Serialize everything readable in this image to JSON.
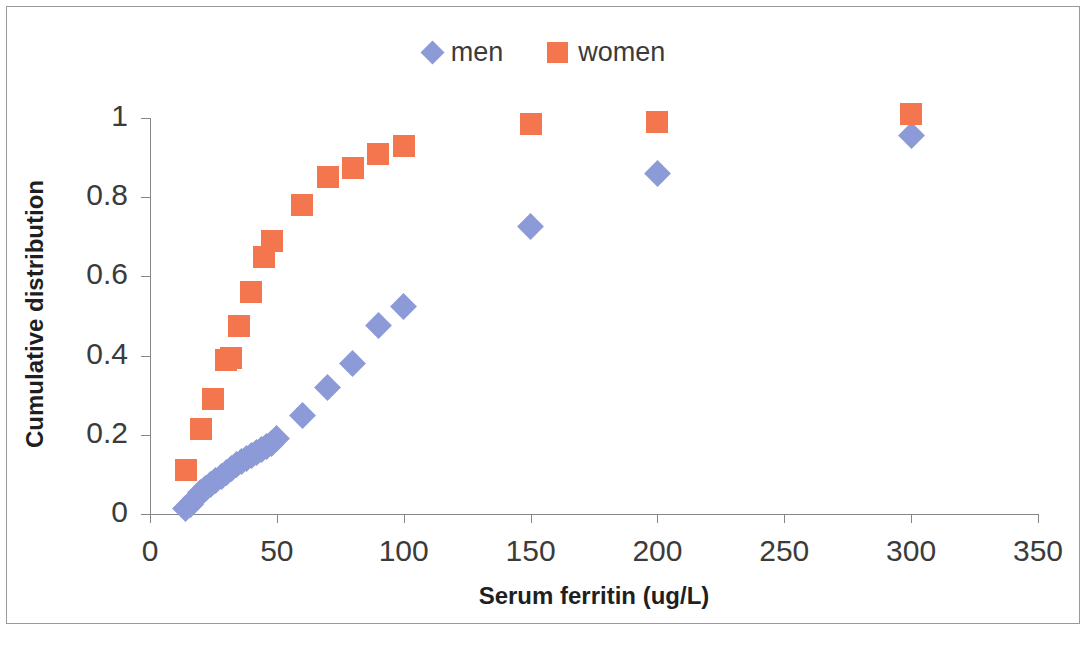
{
  "chart_data": {
    "type": "scatter",
    "title": "",
    "xlabel": "Serum ferritin (ug/L)",
    "ylabel": "Cumulative distribution",
    "xlim": [
      0,
      350
    ],
    "ylim": [
      0,
      1
    ],
    "xticks": [
      0,
      50,
      100,
      150,
      200,
      250,
      300,
      350
    ],
    "yticks": [
      0,
      0.2,
      0.4,
      0.6,
      0.8,
      1
    ],
    "xtick_labels": [
      "0",
      "50",
      "100",
      "150",
      "200",
      "250",
      "300",
      "350"
    ],
    "ytick_labels": [
      "0",
      "0.2",
      "0.4",
      "0.6",
      "0.8",
      "1"
    ],
    "grid": false,
    "legend_position": "top-center",
    "series": [
      {
        "name": "men",
        "marker": "diamond",
        "color": "#8C9AD8",
        "points": [
          [
            14,
            0.015
          ],
          [
            16,
            0.025
          ],
          [
            18,
            0.04
          ],
          [
            20,
            0.055
          ],
          [
            22,
            0.065
          ],
          [
            24,
            0.075
          ],
          [
            26,
            0.085
          ],
          [
            28,
            0.095
          ],
          [
            30,
            0.105
          ],
          [
            32,
            0.115
          ],
          [
            34,
            0.125
          ],
          [
            36,
            0.132
          ],
          [
            38,
            0.14
          ],
          [
            40,
            0.148
          ],
          [
            42,
            0.155
          ],
          [
            44,
            0.162
          ],
          [
            46,
            0.17
          ],
          [
            48,
            0.178
          ],
          [
            50,
            0.19
          ],
          [
            60,
            0.25
          ],
          [
            70,
            0.32
          ],
          [
            80,
            0.38
          ],
          [
            90,
            0.475
          ],
          [
            100,
            0.525
          ],
          [
            150,
            0.725
          ],
          [
            200,
            0.86
          ],
          [
            300,
            0.955
          ]
        ]
      },
      {
        "name": "women",
        "marker": "square",
        "color": "#F4764E",
        "points": [
          [
            14,
            0.11
          ],
          [
            20,
            0.215
          ],
          [
            25,
            0.29
          ],
          [
            30,
            0.39
          ],
          [
            32,
            0.395
          ],
          [
            35,
            0.475
          ],
          [
            40,
            0.56
          ],
          [
            45,
            0.65
          ],
          [
            48,
            0.69
          ],
          [
            60,
            0.78
          ],
          [
            70,
            0.85
          ],
          [
            80,
            0.875
          ],
          [
            90,
            0.91
          ],
          [
            100,
            0.93
          ],
          [
            150,
            0.985
          ],
          [
            200,
            0.99
          ],
          [
            300,
            1.01
          ]
        ]
      }
    ]
  },
  "legend": {
    "entries": [
      {
        "label": "men",
        "marker": "diamond-swatch-icon",
        "color": "#8C9AD8"
      },
      {
        "label": "women",
        "marker": "square-swatch-icon",
        "color": "#F4764E"
      }
    ]
  }
}
